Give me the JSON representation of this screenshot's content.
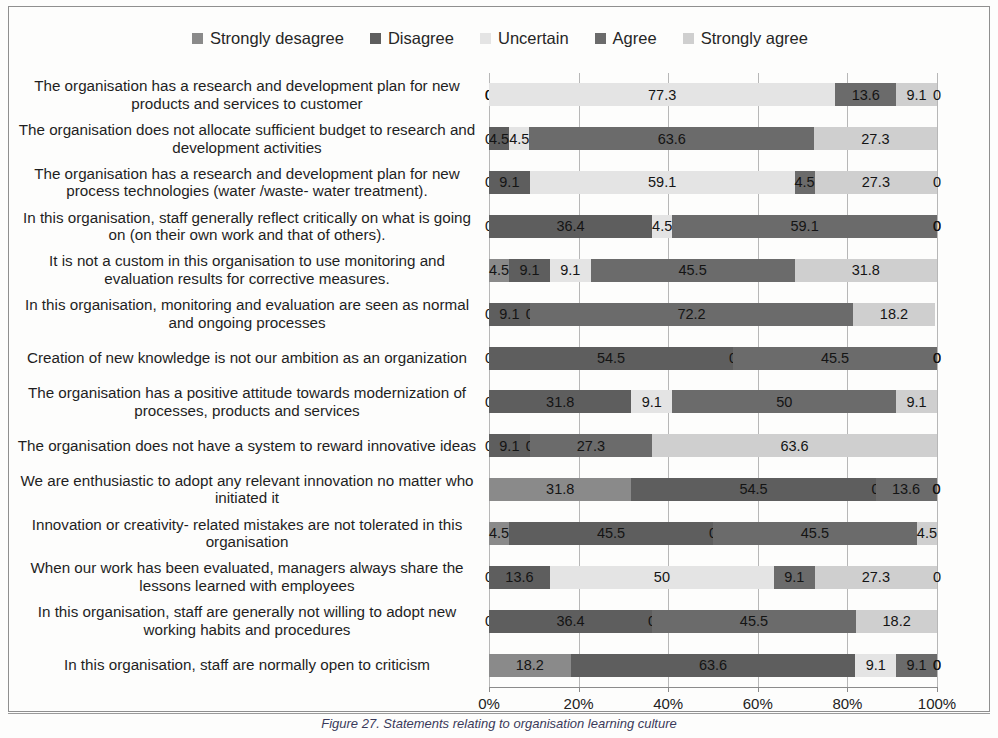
{
  "caption": "Figure 27. Statements relating to organisation learning culture",
  "legend": {
    "position": "top-center",
    "items": [
      {
        "label": "Strongly desagree",
        "color": "#8a8a8a",
        "icon": "legend-square-icon"
      },
      {
        "label": "Disagree",
        "color": "#5e5e5e",
        "icon": "legend-square-icon"
      },
      {
        "label": "Uncertain",
        "color": "#e4e4e4",
        "icon": "legend-square-icon"
      },
      {
        "label": "Agree",
        "color": "#6b6b6b",
        "icon": "legend-square-icon"
      },
      {
        "label": "Strongly agree",
        "color": "#cfcfcf",
        "icon": "legend-square-icon"
      }
    ]
  },
  "axis": {
    "ticks": [
      "0%",
      "20%",
      "40%",
      "60%",
      "80%",
      "100%"
    ],
    "tick_values": [
      0,
      20,
      40,
      60,
      80,
      100
    ],
    "min": 0,
    "max": 100
  },
  "chart_data": {
    "type": "bar",
    "orientation": "horizontal",
    "stacked": true,
    "stacked_mode": "percent",
    "title": "",
    "subtitle": "",
    "xlabel": "",
    "ylabel": "",
    "xlim": [
      0,
      100
    ],
    "grid": true,
    "legend_position": "top-center",
    "series": [
      {
        "name": "Strongly desagree",
        "color": "#8a8a8a",
        "values": [
          0,
          0,
          0,
          0,
          4.5,
          0,
          0,
          0,
          0,
          31.8,
          4.5,
          0,
          0,
          18.2
        ]
      },
      {
        "name": "Disagree",
        "color": "#5e5e5e",
        "values": [
          0,
          4.5,
          9.1,
          36.4,
          9.1,
          9.1,
          54.5,
          31.8,
          9.1,
          54.5,
          45.5,
          13.6,
          36.4,
          63.6
        ]
      },
      {
        "name": "Uncertain",
        "color": "#e4e4e4",
        "values": [
          77.3,
          4.5,
          59.1,
          4.5,
          9.1,
          0,
          0,
          9.1,
          0,
          0,
          0,
          50,
          0,
          9.1
        ]
      },
      {
        "name": "Agree",
        "color": "#6b6b6b",
        "values": [
          13.6,
          63.6,
          4.5,
          59.1,
          45.5,
          72.2,
          45.5,
          50,
          27.3,
          13.6,
          45.5,
          9.1,
          45.5,
          9.1
        ]
      },
      {
        "name": "Strongly agree",
        "color": "#cfcfcf",
        "values": [
          9.1,
          27.3,
          27.3,
          0,
          31.8,
          18.2,
          0,
          9.1,
          63.6,
          0,
          4.5,
          27.3,
          18.2,
          0
        ]
      }
    ],
    "categories": [
      "The organisation has a research and development plan for new products and services to customer",
      "The organisation does not allocate sufficient budget to research and development activities",
      "The organisation has a research and development plan for new process technologies (water /waste- water treatment).",
      "In this organisation, staff generally reflect critically on what is going on (on their own work and that of others).",
      "It is not a custom in this organisation to use monitoring and evaluation results for corrective measures.",
      "In this organisation, monitoring and evaluation are seen as normal and ongoing processes",
      "Creation of new knowledge is not our ambition as an organization",
      "The organisation has a positive attitude towards modernization of processes, products and services",
      "The organisation does not have a system to reward innovative ideas",
      "We are enthusiastic to adopt any relevant innovation no matter who initiated it",
      "Innovation or creativity- related mistakes are not tolerated in this organisation",
      "When our work has been evaluated, managers always share the lessons learned with employees",
      "In this organisation, staff are generally not willing to adopt new working habits and procedures",
      "In this organisation, staff are normally open to criticism"
    ],
    "bars": [
      {
        "category_index": 0,
        "segments": [
          0,
          0,
          77.3,
          13.6,
          9.1
        ],
        "trailing_zero_label": "0"
      },
      {
        "category_index": 1,
        "segments": [
          0,
          4.5,
          4.5,
          63.6,
          27.3
        ],
        "trailing_zero_label": ""
      },
      {
        "category_index": 2,
        "segments": [
          0,
          9.1,
          59.1,
          4.5,
          27.3
        ],
        "trailing_zero_label": "0"
      },
      {
        "category_index": 3,
        "segments": [
          0,
          36.4,
          4.5,
          59.1,
          0
        ],
        "trailing_zero_label": "0"
      },
      {
        "category_index": 4,
        "segments": [
          4.5,
          9.1,
          9.1,
          45.5,
          31.8
        ],
        "trailing_zero_label": ""
      },
      {
        "category_index": 5,
        "segments": [
          0,
          9.1,
          0,
          72.2,
          18.2
        ],
        "trailing_zero_label": ""
      },
      {
        "category_index": 6,
        "segments": [
          0,
          54.5,
          0,
          45.5,
          0
        ],
        "trailing_zero_label": "0"
      },
      {
        "category_index": 7,
        "segments": [
          0,
          31.8,
          9.1,
          50,
          9.1
        ],
        "trailing_zero_label": ""
      },
      {
        "category_index": 8,
        "segments": [
          0,
          9.1,
          0,
          27.3,
          63.6
        ],
        "trailing_zero_label": ""
      },
      {
        "category_index": 9,
        "segments": [
          31.8,
          54.5,
          0,
          13.6,
          0
        ],
        "trailing_zero_label": "0"
      },
      {
        "category_index": 10,
        "segments": [
          4.5,
          45.5,
          0,
          45.5,
          4.5
        ],
        "trailing_zero_label": ""
      },
      {
        "category_index": 11,
        "segments": [
          0,
          13.6,
          50,
          9.1,
          27.3
        ],
        "trailing_zero_label": "0"
      },
      {
        "category_index": 12,
        "segments": [
          0,
          36.4,
          0,
          45.5,
          18.2
        ],
        "trailing_zero_label": ""
      },
      {
        "category_index": 13,
        "segments": [
          18.2,
          63.6,
          9.1,
          9.1,
          0
        ],
        "trailing_zero_label": "0"
      }
    ]
  }
}
